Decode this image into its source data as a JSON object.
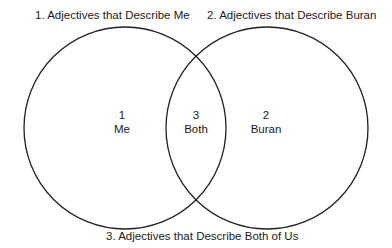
{
  "diagram": {
    "type": "venn",
    "sets": [
      {
        "id": "1",
        "caption": "1.  Adjectives that Describe Me",
        "number": "1",
        "name": "Me"
      },
      {
        "id": "2",
        "caption": "2.  Adjectives that Describe Buran",
        "number": "2",
        "name": "Buran"
      }
    ],
    "intersection": {
      "id": "3",
      "caption": "3.  Adjectives that Describe Both of Us",
      "number": "3",
      "name": "Both"
    },
    "stroke_color": "#222222"
  }
}
